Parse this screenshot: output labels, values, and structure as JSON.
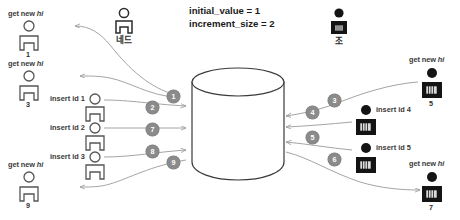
{
  "diagram": {
    "title_params": {
      "line1": "initial_value = 1",
      "line2": "increment_size = 2"
    },
    "actors": [
      {
        "id": "ned",
        "name": "네드",
        "style": "outline"
      },
      {
        "id": "jo",
        "name": "조",
        "style": "filled"
      }
    ],
    "database": {
      "name": "database-cylinder"
    },
    "left_clients": [
      {
        "label": "get new ",
        "emph": "hi",
        "id": "1"
      },
      {
        "label": "get new ",
        "emph": "hi",
        "id": "3"
      },
      {
        "label": "get new ",
        "emph": "hi",
        "id": "9"
      }
    ],
    "left_inserts": [
      {
        "label": "insert id 1"
      },
      {
        "label": "insert id 2"
      },
      {
        "label": "insert id 3"
      }
    ],
    "right_clients": [
      {
        "label": "get new ",
        "emph": "hi",
        "id": "5"
      },
      {
        "label": "get new ",
        "emph": "hi",
        "id": "7"
      }
    ],
    "right_inserts": [
      {
        "label": "insert id  4"
      },
      {
        "label": "insert id  5"
      }
    ],
    "steps_left": [
      "1",
      "2",
      "7",
      "8",
      "9"
    ],
    "steps_right": [
      "3",
      "4",
      "5",
      "6"
    ],
    "colors": {
      "line": "#9a9a9a",
      "outline_figure": "#555555",
      "filled_figure": "#1a1a1a",
      "step_badge": "#8b8b8b",
      "text": "#3a3a3a"
    }
  }
}
